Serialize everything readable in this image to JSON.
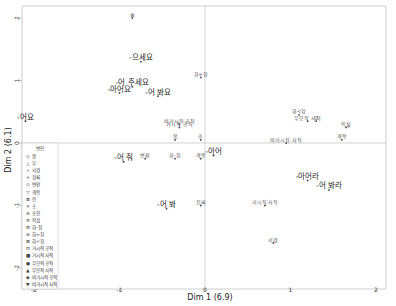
{
  "chart_data": {
    "type": "scatter",
    "title": "",
    "xlabel": "Dim 1 (6.9)",
    "ylabel": "Dim 2 (6.1)",
    "xlim": [
      -2.1,
      2.1
    ],
    "ylim": [
      -2.1,
      2.1
    ],
    "x_ticks": [
      -2,
      -1,
      0,
      1,
      2
    ],
    "y_ticks": [
      2,
      1,
      0,
      -1,
      -2
    ],
    "grid": false,
    "reference_lines": {
      "x": 0,
      "y": 0
    },
    "legend": {
      "title": "변인",
      "position": "left-bottom inside",
      "entries": [
        {
          "symbol": "◇",
          "label": "봄"
        },
        {
          "symbol": "△",
          "label": "부"
        },
        {
          "symbol": "+",
          "label": "서경"
        },
        {
          "symbol": "×",
          "label": "청록"
        },
        {
          "symbol": "◇",
          "label": "변환"
        },
        {
          "symbol": "▽",
          "label": "개항"
        },
        {
          "symbol": "⊠",
          "label": "진"
        },
        {
          "symbol": "✳",
          "label": "소"
        },
        {
          "symbol": "⊕",
          "label": "조전"
        },
        {
          "symbol": "✲",
          "label": "직설"
        },
        {
          "symbol": "⊞",
          "label": "화-청"
        },
        {
          "symbol": "⊛",
          "label": "화=청"
        },
        {
          "symbol": "⊠",
          "label": "화<청"
        },
        {
          "symbol": "⊟",
          "label": "거시적 공적"
        },
        {
          "symbol": "■",
          "label": "거시적 사적"
        },
        {
          "symbol": "●",
          "label": "우모적 공적"
        },
        {
          "symbol": "▲",
          "label": "우모적 사적"
        },
        {
          "symbol": "◆",
          "label": "비거시적 공적"
        },
        {
          "symbol": "▼",
          "label": "비거시적 사적"
        }
      ]
    },
    "points": [
      {
        "label": "-으세요",
        "x": -0.75,
        "y": 1.3,
        "emphasis": true
      },
      {
        "label": "-어 주세요",
        "x": -0.85,
        "y": 0.9,
        "emphasis": true
      },
      {
        "label": "-아어요",
        "x": -1.0,
        "y": 0.8,
        "emphasis": true
      },
      {
        "label": "-어 봐요",
        "x": -0.55,
        "y": 0.75,
        "emphasis": true
      },
      {
        "label": "-어요",
        "x": -2.1,
        "y": 0.35,
        "emphasis": true
      },
      {
        "label": "-어 줘",
        "x": -0.95,
        "y": -0.3,
        "emphasis": true
      },
      {
        "label": "-어 봐",
        "x": -0.45,
        "y": -1.05,
        "emphasis": true
      },
      {
        "label": "-아어",
        "x": 0.1,
        "y": -0.2,
        "emphasis": true
      },
      {
        "label": "-아어라",
        "x": 1.2,
        "y": -0.6,
        "emphasis": true
      },
      {
        "label": "-어 봐라",
        "x": 1.45,
        "y": -0.75,
        "emphasis": true
      },
      {
        "label": "화=청",
        "x": -0.05,
        "y": 1.05
      },
      {
        "label": "화<청",
        "x": 1.1,
        "y": 0.45
      },
      {
        "label": "비거시적 공적",
        "x": -0.3,
        "y": 0.3
      },
      {
        "label": "거시적 공적",
        "x": -0.3,
        "y": 0.25
      },
      {
        "label": "우모적 사적",
        "x": 1.2,
        "y": 0.35
      },
      {
        "label": "부",
        "x": 1.3,
        "y": 0.35
      },
      {
        "label": "직설",
        "x": 1.65,
        "y": 0.25
      },
      {
        "label": "개항",
        "x": 1.6,
        "y": 0.05
      },
      {
        "label": "비거시적 사적",
        "x": 0.95,
        "y": 0.0
      },
      {
        "label": "봄",
        "x": -0.35,
        "y": 0.05
      },
      {
        "label": "조",
        "x": -0.05,
        "y": 0.05
      },
      {
        "label": "변환",
        "x": -0.7,
        "y": -0.25
      },
      {
        "label": "화-청",
        "x": -0.35,
        "y": -0.25
      },
      {
        "label": "개항",
        "x": -0.05,
        "y": -0.25
      },
      {
        "label": "진짜",
        "x": -0.05,
        "y": -1.0
      },
      {
        "label": "거시적 사적",
        "x": 0.7,
        "y": -1.0
      },
      {
        "label": "서경",
        "x": 0.8,
        "y": -1.6
      },
      {
        "label": "⊠",
        "x": -0.85,
        "y": 2.0
      }
    ]
  },
  "plot": {
    "x_tick_labels": [
      "-2",
      "-1",
      "0",
      "1",
      "2"
    ],
    "y_tick_labels": [
      "2",
      "1",
      "0",
      "-1",
      "-2"
    ]
  }
}
